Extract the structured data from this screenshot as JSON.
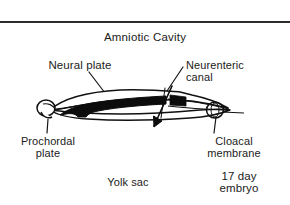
{
  "figure": {
    "title": "Amniotic Cavity",
    "background_color": "#ffffff",
    "ink_color": "#1b1b1b",
    "rule_color": "#2b2b2b"
  },
  "labels": {
    "amniotic_cavity": "Amniotic Cavity",
    "neural_plate": "Neural plate",
    "neurenteric_canal": "Neurenteric\ncanal",
    "prochordal_plate": "Prochordal\nplate",
    "cloacal_membrane": "Cloacal\nmembrane",
    "yolk_sac": "Yolk sac",
    "embryo_age": "17 day\nembryo"
  },
  "diagram": {
    "elements": [
      {
        "name": "top-rule",
        "kind": "horizontal-divider"
      },
      {
        "name": "embryonic-disc-outline",
        "kind": "outline"
      },
      {
        "name": "notochord-band",
        "kind": "filled-black-band"
      },
      {
        "name": "prochordal-plate-bulb",
        "kind": "rounded-bulb-left"
      },
      {
        "name": "cloacal-membrane-ring",
        "kind": "ring-right"
      },
      {
        "name": "neurenteric-canal-arrow",
        "kind": "arrow-down-left"
      },
      {
        "name": "leader-line-neural-plate",
        "kind": "leader"
      },
      {
        "name": "leader-line-neurenteric-canal",
        "kind": "leader"
      },
      {
        "name": "leader-line-prochordal-plate",
        "kind": "leader"
      },
      {
        "name": "leader-line-cloacal-membrane",
        "kind": "leader"
      }
    ]
  }
}
